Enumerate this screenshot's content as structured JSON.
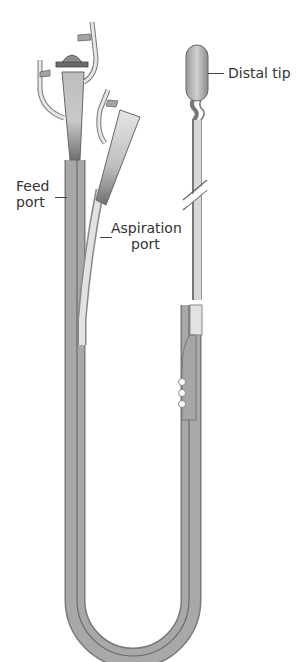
{
  "figure": {
    "colors": {
      "background": "#ffffff",
      "tube_outer": "#8c8c8c",
      "tube_inner": "#b4b4b4",
      "tube_highlight": "#dcdcdc",
      "hub_dark": "#6e6e6e",
      "label_text": "#333333"
    }
  },
  "labels": {
    "distal_tip": "Distal tip",
    "feed_port_line1": "Feed",
    "feed_port_line2": "port",
    "aspiration_port_line1": "Aspiration",
    "aspiration_port_line2": "port"
  }
}
